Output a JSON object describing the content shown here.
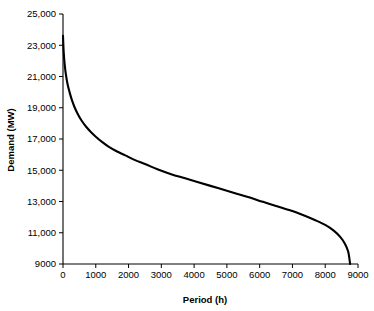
{
  "chart_data": {
    "type": "line",
    "title": "",
    "xlabel": "Period (h)",
    "ylabel": "Demand (MW)",
    "xlim": [
      0,
      9000
    ],
    "ylim": [
      9000,
      25000
    ],
    "grid": false,
    "legend": null,
    "xticks": [
      "0",
      "1000",
      "2000",
      "3000",
      "4000",
      "5000",
      "6000",
      "7000",
      "8000",
      "9000"
    ],
    "xtick_values": [
      0,
      1000,
      2000,
      3000,
      4000,
      5000,
      6000,
      7000,
      8000,
      9000
    ],
    "yticks": [
      "9000",
      "11,000",
      "13,000",
      "15,000",
      "17,000",
      "19,000",
      "21,000",
      "23,000",
      "25,000"
    ],
    "ytick_values": [
      9000,
      11000,
      13000,
      15000,
      17000,
      19000,
      21000,
      23000,
      25000
    ],
    "series": [
      {
        "name": "Load duration curve",
        "color": "#000000",
        "x": [
          0,
          20,
          50,
          90,
          140,
          200,
          270,
          350,
          450,
          560,
          700,
          850,
          1000,
          1200,
          1400,
          1650,
          1900,
          2200,
          2500,
          2900,
          3300,
          3700,
          4100,
          4500,
          4900,
          5300,
          5700,
          6100,
          6500,
          6900,
          7300,
          7700,
          8000,
          8250,
          8450,
          8600,
          8700,
          8760
        ],
        "y": [
          23600,
          22600,
          21800,
          21100,
          20500,
          20000,
          19500,
          19050,
          18600,
          18200,
          17800,
          17450,
          17150,
          16800,
          16500,
          16200,
          15950,
          15650,
          15400,
          15050,
          14750,
          14500,
          14250,
          14000,
          13750,
          13500,
          13250,
          12980,
          12720,
          12450,
          12150,
          11800,
          11500,
          11150,
          10750,
          10300,
          9800,
          9000
        ]
      }
    ]
  }
}
